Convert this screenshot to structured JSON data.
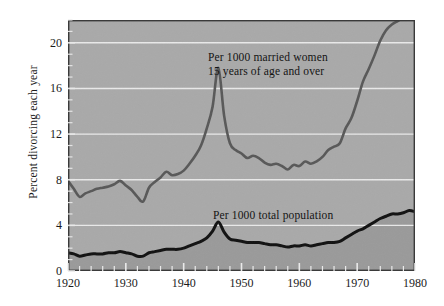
{
  "figure": {
    "ylabel": "Percent divorcing each year",
    "background_color": "#a9a9a9",
    "fill_color": "#9a9a9a",
    "gridline_color": "#efefef",
    "axis_color": "#3a3a3a"
  },
  "annotations": {
    "married_women_line1": "Per 1000 married women",
    "married_women_line2": "15 years of age and over",
    "total_population": "Per 1000 total population"
  },
  "chart_data": {
    "type": "line",
    "title": "",
    "xlabel": "",
    "ylabel": "Percent divorcing each year",
    "xlim": [
      1920,
      1980
    ],
    "ylim": [
      0,
      22.0
    ],
    "xticks": [
      1920,
      1930,
      1940,
      1950,
      1960,
      1970,
      1980
    ],
    "yticks": [
      0,
      4,
      8,
      12,
      16,
      20
    ],
    "minor_xtick_interval": 2,
    "minor_ytick_interval": 1,
    "grid": "horizontal-major-only",
    "legend_position": "inline-annotations",
    "series": [
      {
        "name": "Per 1000 married women 15 years of age and over",
        "color": "#585858",
        "line_width": 2.6,
        "x": [
          1920,
          1921,
          1922,
          1923,
          1924,
          1925,
          1926,
          1927,
          1928,
          1929,
          1930,
          1931,
          1932,
          1933,
          1934,
          1935,
          1936,
          1937,
          1938,
          1939,
          1940,
          1941,
          1942,
          1943,
          1944,
          1945,
          1946,
          1947,
          1948,
          1949,
          1950,
          1951,
          1952,
          1953,
          1954,
          1955,
          1956,
          1957,
          1958,
          1959,
          1960,
          1961,
          1962,
          1963,
          1964,
          1965,
          1966,
          1967,
          1968,
          1969,
          1970,
          1971,
          1972,
          1973,
          1974,
          1975,
          1976,
          1977,
          1978,
          1979,
          1980
        ],
        "y": [
          7.9,
          7.2,
          6.5,
          6.8,
          7.0,
          7.2,
          7.3,
          7.4,
          7.6,
          7.9,
          7.5,
          7.1,
          6.5,
          6.1,
          7.3,
          7.8,
          8.2,
          8.7,
          8.4,
          8.5,
          8.8,
          9.4,
          10.1,
          11.0,
          12.5,
          14.4,
          17.8,
          13.6,
          11.2,
          10.6,
          10.3,
          9.9,
          10.1,
          9.9,
          9.5,
          9.3,
          9.4,
          9.2,
          8.9,
          9.3,
          9.2,
          9.6,
          9.4,
          9.6,
          10.0,
          10.6,
          10.9,
          11.2,
          12.5,
          13.4,
          14.9,
          16.6,
          17.7,
          18.9,
          20.2,
          21.1,
          21.6,
          21.9,
          22.2,
          22.4,
          22.5
        ]
      },
      {
        "name": "Per 1000 total population",
        "color": "#111111",
        "line_width": 3.0,
        "x": [
          1920,
          1921,
          1922,
          1923,
          1924,
          1925,
          1926,
          1927,
          1928,
          1929,
          1930,
          1931,
          1932,
          1933,
          1934,
          1935,
          1936,
          1937,
          1938,
          1939,
          1940,
          1941,
          1942,
          1943,
          1944,
          1945,
          1946,
          1947,
          1948,
          1949,
          1950,
          1951,
          1952,
          1953,
          1954,
          1955,
          1956,
          1957,
          1958,
          1959,
          1960,
          1961,
          1962,
          1963,
          1964,
          1965,
          1966,
          1967,
          1968,
          1969,
          1970,
          1971,
          1972,
          1973,
          1974,
          1975,
          1976,
          1977,
          1978,
          1979,
          1980
        ],
        "y": [
          1.6,
          1.5,
          1.3,
          1.4,
          1.5,
          1.5,
          1.5,
          1.6,
          1.6,
          1.7,
          1.6,
          1.5,
          1.3,
          1.3,
          1.6,
          1.7,
          1.8,
          1.9,
          1.9,
          1.9,
          2.0,
          2.2,
          2.4,
          2.6,
          2.9,
          3.5,
          4.3,
          3.4,
          2.8,
          2.7,
          2.6,
          2.5,
          2.5,
          2.5,
          2.4,
          2.3,
          2.3,
          2.2,
          2.1,
          2.2,
          2.2,
          2.3,
          2.2,
          2.3,
          2.4,
          2.5,
          2.5,
          2.6,
          2.9,
          3.2,
          3.5,
          3.7,
          4.0,
          4.3,
          4.6,
          4.8,
          5.0,
          5.0,
          5.1,
          5.3,
          5.2
        ]
      }
    ]
  }
}
